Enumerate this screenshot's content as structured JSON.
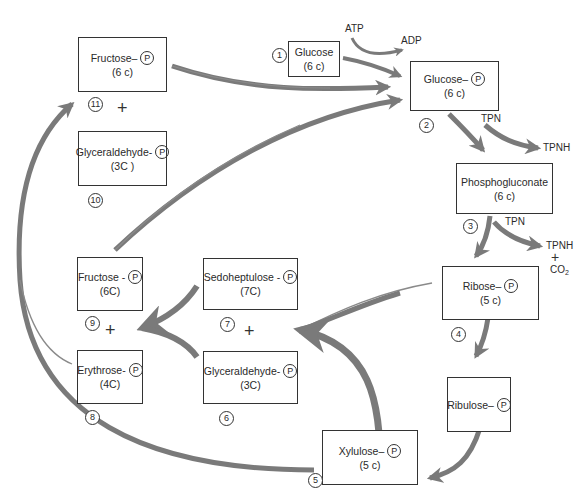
{
  "diagram": {
    "type": "metabolic-pathway",
    "phosphate_symbol": "P",
    "colors": {
      "arrow": "#7a7a7a",
      "thin_line": "#8a8a8a",
      "box_border": "#333333",
      "background": "#ffffff"
    }
  },
  "nodes": {
    "glucose": {
      "num": "1",
      "name": "Glucose",
      "carbons": "(6 c)",
      "phosphate": false
    },
    "glucose_p": {
      "num": "2",
      "name": "Glucose–",
      "carbons": "(6 c)",
      "phosphate": true
    },
    "phosphogluconate": {
      "num": "3",
      "name": "Phosphogluconate",
      "carbons": "(6 c)",
      "phosphate": false
    },
    "ribose_p": {
      "num": "4",
      "name": "Ribose–",
      "carbons": "(5 c)",
      "phosphate": true
    },
    "ribulose_p": {
      "num": "",
      "name": "Ribulose–",
      "carbons": "",
      "phosphate": true
    },
    "xylulose_p": {
      "num": "5",
      "name": "Xylulose–",
      "carbons": "(5 c)",
      "phosphate": true
    },
    "glyceraldehyde_p_6": {
      "num": "6",
      "name": "Glyceraldehyde-",
      "carbons": "(3C)",
      "phosphate": true
    },
    "sedoheptulose_p": {
      "num": "7",
      "name": "Sedoheptulose -",
      "carbons": "(7C)",
      "phosphate": true
    },
    "erythrose_p": {
      "num": "8",
      "name": "Erythrose-",
      "carbons": "(4C)",
      "phosphate": true
    },
    "fructose_p_9": {
      "num": "9",
      "name": "Fructose -",
      "carbons": "(6C)",
      "phosphate": true
    },
    "glyceraldehyde_p_10": {
      "num": "10",
      "name": "Glyceraldehyde-",
      "carbons": "(3C )",
      "phosphate": true
    },
    "fructose_p_11": {
      "num": "11",
      "name": "Fructose–",
      "carbons": "(6 c)",
      "phosphate": true
    }
  },
  "cofactors": {
    "atp": "ATP",
    "adp": "ADP",
    "tpn_1": "TPN",
    "tpnh_1": "TPNH",
    "tpn_2": "TPN",
    "tpnh_2": "TPNH",
    "co2": "CO",
    "co2_sub": "2"
  },
  "symbols": {
    "plus": "+"
  },
  "edges": [
    {
      "from": "glucose",
      "to": "glucose_p",
      "cofactor_in": "ATP",
      "cofactor_out": "ADP"
    },
    {
      "from": "glucose_p",
      "to": "phosphogluconate",
      "cofactor_in": "TPN",
      "cofactor_out": "TPNH"
    },
    {
      "from": "phosphogluconate",
      "to": "ribose_p",
      "cofactor_in": "TPN",
      "cofactor_out": "TPNH + CO2"
    },
    {
      "from": "ribose_p",
      "to": "ribulose_p"
    },
    {
      "from": "ribulose_p",
      "to": "xylulose_p"
    },
    {
      "from": "ribose_p + xylulose_p",
      "to": "sedoheptulose_p + glyceraldehyde_p_6"
    },
    {
      "from": "sedoheptulose_p + glyceraldehyde_p_6",
      "to": "fructose_p_9 + erythrose_p"
    },
    {
      "from": "erythrose_p + xylulose_p",
      "to": "fructose_p_11 + glyceraldehyde_p_10"
    },
    {
      "from": "fructose_p_9",
      "to": "glucose_p"
    },
    {
      "from": "fructose_p_11",
      "to": "glucose_p"
    }
  ]
}
